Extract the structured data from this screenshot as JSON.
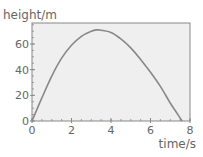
{
  "chart_data": {
    "type": "line",
    "title": "",
    "xlabel": "time/s",
    "ylabel": "height/m",
    "xlim": [
      0,
      8
    ],
    "ylim": [
      0,
      70
    ],
    "x_ticks": [
      0,
      2,
      4,
      6,
      8
    ],
    "y_ticks": [
      0,
      20,
      40,
      60
    ],
    "x_tick_labels": [
      "0",
      "2",
      "4",
      "6",
      "8"
    ],
    "y_tick_labels": [
      "0",
      "20",
      "40",
      "60"
    ],
    "x_minor_step": 0.5,
    "y_minor_step": 5,
    "grid": false,
    "legend": null,
    "series": [
      {
        "name": "height",
        "color": "#888888",
        "x": [
          0,
          0.5,
          1,
          1.5,
          2,
          2.5,
          3,
          3.3,
          3.5,
          4,
          4.5,
          5,
          5.5,
          6,
          6.5,
          7,
          7.3,
          7.6
        ],
        "y": [
          0,
          18,
          35,
          49,
          59,
          66,
          70,
          71,
          70.7,
          69,
          64,
          57,
          48,
          38,
          27,
          14,
          7,
          0
        ]
      }
    ]
  },
  "style": {
    "plot_background": "#efefef",
    "axis_color": "#888888",
    "text_color": "#666666"
  }
}
